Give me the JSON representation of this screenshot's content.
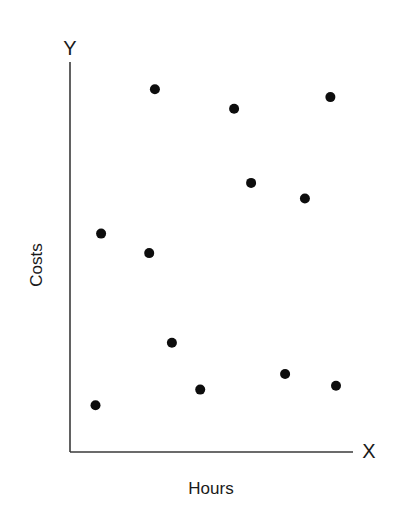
{
  "chart_data": {
    "type": "scatter",
    "title": "",
    "xlabel": "Hours",
    "ylabel": "Costs",
    "x_axis_letter": "X",
    "y_axis_letter": "Y",
    "xlim": [
      0,
      100
    ],
    "ylim": [
      0,
      100
    ],
    "grid": false,
    "legend": null,
    "ticks": "none",
    "units_note": "Axes have no tick labels; values are relative positions (0-100) along each axis.",
    "points": [
      {
        "x": 30,
        "y": 93
      },
      {
        "x": 58,
        "y": 88
      },
      {
        "x": 92,
        "y": 91
      },
      {
        "x": 64,
        "y": 69
      },
      {
        "x": 83,
        "y": 65
      },
      {
        "x": 11,
        "y": 56
      },
      {
        "x": 28,
        "y": 51
      },
      {
        "x": 36,
        "y": 28
      },
      {
        "x": 46,
        "y": 16
      },
      {
        "x": 76,
        "y": 20
      },
      {
        "x": 94,
        "y": 17
      },
      {
        "x": 9,
        "y": 12
      }
    ]
  },
  "layout": {
    "origin_px": [
      70,
      452
    ],
    "x_end_px": 353,
    "y_end_px": 62,
    "point_radius_px": 5,
    "point_color": "#0d0d0d",
    "axis_color": "#3a3a3a"
  }
}
